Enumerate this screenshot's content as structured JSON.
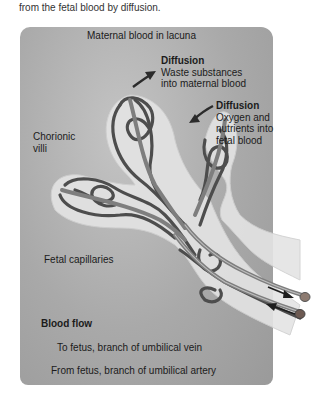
{
  "caption": "from the fetal blood by diffusion.",
  "diagram": {
    "top_label": "Maternal blood in lacuna",
    "diffusion_out": {
      "title": "Diffusion",
      "line1": "Waste substances",
      "line2": "into maternal blood"
    },
    "diffusion_in": {
      "title": "Diffusion",
      "line1": "Oxygen and",
      "line2": "nutrients into",
      "line3": "fetal blood"
    },
    "chorionic_villi": {
      "line1": "Chorionic",
      "line2": "villi"
    },
    "fetal_capillaries": "Fetal capillaries",
    "legend": {
      "title": "Blood flow",
      "vein": "To fetus, branch of umbilical vein",
      "artery": "From fetus, branch of umbilical artery"
    }
  },
  "colors": {
    "panel": "#a9a9a9",
    "villus": "#e6e6e6",
    "vessel_dark": "#4a4a4a",
    "vessel_light": "#808080"
  }
}
